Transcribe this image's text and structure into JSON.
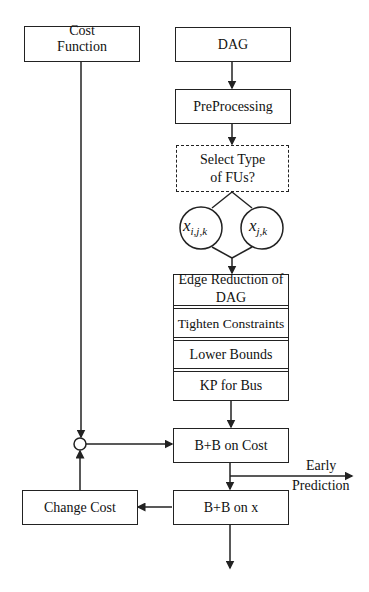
{
  "nodes": {
    "cost_function": "Cost Function",
    "dag": "DAG",
    "preprocessing": "PreProcessing",
    "select_type": "Select Type of FUs?",
    "x_ijk_var": "x",
    "x_ijk_sub": "i,j,k",
    "x_jk_var": "x",
    "x_jk_sub": "j,k",
    "edge_reduction": "Edge Reduction of DAG",
    "tighten_constraints": "Tighten Constraints",
    "lower_bounds": "Lower Bounds",
    "kp_for_bus": "KP for Bus",
    "bb_on_cost": "B+B on Cost",
    "bb_on_x": "B+B on x",
    "change_cost": "Change Cost"
  },
  "edge_labels": {
    "early": "Early",
    "prediction": "Prediction"
  }
}
